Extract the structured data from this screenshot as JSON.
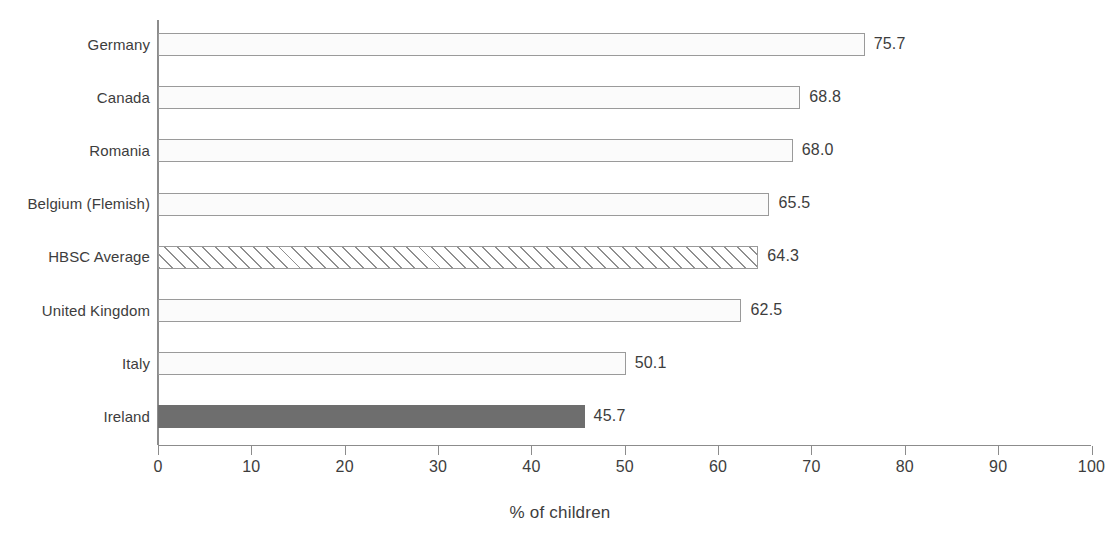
{
  "chart_data": {
    "type": "bar",
    "orientation": "horizontal",
    "title": "",
    "xlabel": "% of children",
    "ylabel": "",
    "xlim": [
      0,
      100
    ],
    "xticks": [
      0,
      10,
      20,
      30,
      40,
      50,
      60,
      70,
      80,
      90,
      100
    ],
    "xtick_labels": [
      "0",
      "10",
      "20",
      "30",
      "40",
      "50",
      "60",
      "70",
      "80",
      "90",
      "100"
    ],
    "grid": false,
    "legend": false,
    "categories": [
      "Germany",
      "Canada",
      "Romania",
      "Belgium (Flemish)",
      "HBSC Average",
      "United Kingdom",
      "Italy",
      "Ireland"
    ],
    "values": [
      75.7,
      68.8,
      68.0,
      65.5,
      64.3,
      62.5,
      50.1,
      45.7
    ],
    "value_labels": [
      "75.7",
      "68.8",
      "68.0",
      "65.5",
      "64.3",
      "62.5",
      "50.1",
      "45.7"
    ],
    "bar_styles": [
      "open",
      "open",
      "open",
      "open",
      "hatched",
      "open",
      "open",
      "solid-dark"
    ],
    "colors": {
      "bar_fill": "#fbfbfb",
      "bar_border": "#9a9a9a",
      "highlight_fill": "#6e6e6e",
      "hatch_line": "#8f8f8f",
      "axis": "#8c8c8c",
      "text": "#3d3d3d",
      "background": "#ffffff"
    }
  }
}
